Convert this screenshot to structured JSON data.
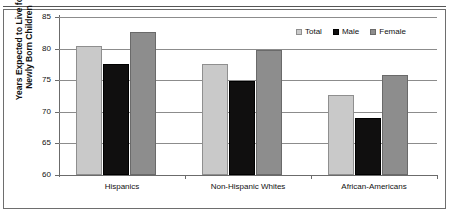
{
  "top_fragment": {
    "text": "                                        "
  },
  "chart_data": {
    "type": "bar",
    "title": "",
    "xlabel": "",
    "ylabel_lines": [
      "Years Expected to Live for",
      "Newly Born Children"
    ],
    "ylabel": "Years Expected to Live for Newly Born Children",
    "ylim": [
      60,
      85
    ],
    "ytick_step": 5,
    "yticks": [
      85,
      80,
      75,
      70,
      65,
      60
    ],
    "ytick_labels": [
      "85",
      "80",
      "75",
      "70",
      "65",
      "60"
    ],
    "grid": true,
    "grid_axis": "y",
    "legend_position": "top-right",
    "categories": [
      "Hispanics",
      "Non-Hispanic Whites",
      "African-Americans"
    ],
    "series": [
      {
        "name": "Total",
        "color": "#c9c9c9",
        "values": [
          80.4,
          77.5,
          72.6
        ]
      },
      {
        "name": "Male",
        "color": "#100f0f",
        "values": [
          77.6,
          74.9,
          69.1
        ]
      },
      {
        "name": "Female",
        "color": "#8d8d8d",
        "values": [
          82.7,
          79.8,
          75.8
        ]
      }
    ]
  }
}
